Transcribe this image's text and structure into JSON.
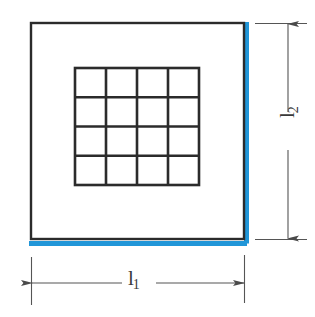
{
  "diagram": {
    "type": "engineering-dimension-drawing",
    "background_color": "#ffffff",
    "line_color": "#2b2b2b",
    "dimension_line_color": "#555555",
    "accent_color": "#2196d8",
    "outer_square": {
      "name": "plate-outline",
      "x": 31,
      "y": 23,
      "width": 213,
      "height": 216,
      "stroke_width": 2.4
    },
    "accent_edges": {
      "name": "highlighted-edges",
      "color": "#2196d8",
      "edges": [
        "right",
        "bottom"
      ],
      "thickness": 5
    },
    "grid": {
      "name": "inner-grid",
      "rows": 4,
      "columns": 4,
      "cells": 16,
      "x": 75,
      "y": 68,
      "width": 124,
      "height": 117,
      "stroke_width": 2.6
    },
    "dimensions": [
      {
        "name": "width-dimension",
        "label_base": "l",
        "label_sub": "1",
        "orientation": "horizontal",
        "arrow_start": 31,
        "arrow_end": 244,
        "line_y": 283
      },
      {
        "name": "height-dimension",
        "label_base": "l",
        "label_sub": "2",
        "orientation": "vertical",
        "arrow_start": 23,
        "arrow_end": 239,
        "line_x": 288
      }
    ]
  }
}
